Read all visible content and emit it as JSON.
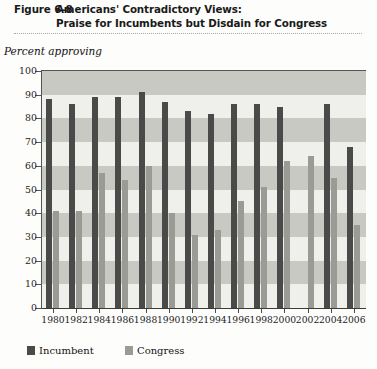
{
  "figure": {
    "number": "Figure 6-8",
    "title_line1": "Americans' Contradictory Views:",
    "title_line2": "Praise for Incumbents but Disdain for Congress"
  },
  "axis_caption": "Percent approving",
  "legend": {
    "incumbent_label": "Incumbent",
    "congress_label": "Congress"
  },
  "colors": {
    "incumbent": "#4a4a48",
    "congress": "#9b9b96",
    "plot_background": "#efefec",
    "band": "#c9c9c4",
    "axis": "#55544f"
  },
  "chart_data": {
    "type": "bar",
    "title": "Figure 6-8 Americans' Contradictory Views: Praise for Incumbents but Disdain for Congress",
    "xlabel": "",
    "ylabel": "Percent approving",
    "ylim": [
      0,
      100
    ],
    "ytick_step": 10,
    "yticks": [
      0,
      10,
      20,
      30,
      40,
      50,
      60,
      70,
      80,
      90,
      100
    ],
    "ytick_labels": [
      "0",
      "10",
      "20",
      "30",
      "40",
      "50",
      "60",
      "70",
      "80",
      "90",
      "100"
    ],
    "grid": "alternating horizontal bands",
    "legend_position": "below-left",
    "categories": [
      "1980",
      "1982",
      "1984",
      "1986",
      "1988",
      "1990",
      "1992",
      "1994",
      "1996",
      "1998",
      "2000",
      "2002",
      "2004",
      "2006"
    ],
    "series": [
      {
        "name": "Incumbent",
        "color": "#4a4a48",
        "values": [
          88,
          86,
          89,
          89,
          91,
          87,
          83,
          82,
          86,
          86,
          85,
          null,
          86,
          68
        ]
      },
      {
        "name": "Congress",
        "color": "#9b9b96",
        "values": [
          41,
          41,
          57,
          54,
          60,
          40,
          31,
          33,
          45,
          51,
          62,
          64,
          55,
          35
        ]
      }
    ]
  }
}
